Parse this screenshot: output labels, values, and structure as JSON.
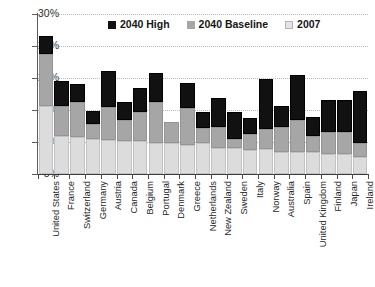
{
  "chart_data": {
    "type": "bar",
    "subtype": "stacked-bar",
    "title": "",
    "xlabel": "",
    "ylabel": "",
    "ylim": [
      5,
      30
    ],
    "ytick_labels": [
      "30%",
      "25%",
      "20%",
      "15%",
      "10%",
      "5%"
    ],
    "ytick_values": [
      30,
      25,
      20,
      15,
      10,
      5
    ],
    "grid": true,
    "grid_axis": "y",
    "legend_position": "top-center",
    "units": "percent",
    "stacked_cumulative": true,
    "categories": [
      "United States",
      "France",
      "Switzerland",
      "Germany",
      "Austria",
      "Canada",
      "Belgium",
      "Portugal",
      "Denmark",
      "Greece",
      "Netherlands",
      "New Zealand",
      "Sweden",
      "Italy",
      "Norway",
      "Australia",
      "Spain",
      "United Kingdom",
      "Finland",
      "Japan",
      "Ireland"
    ],
    "series": [
      {
        "name": "2007",
        "color": "#dcdcdc",
        "values": [
          15.7,
          11.0,
          10.8,
          10.4,
          10.3,
          10.1,
          10.2,
          9.9,
          9.8,
          9.6,
          9.8,
          9.0,
          9.1,
          8.7,
          8.9,
          8.5,
          8.5,
          8.4,
          8.2,
          8.1,
          7.6
        ]
      },
      {
        "name": "2040 Baseline",
        "color": "#a6a6a6",
        "values": [
          23.8,
          15.7,
          16.3,
          12.8,
          15.4,
          13.5,
          14.7,
          16.2,
          13.1,
          15.3,
          12.2,
          12.4,
          10.4,
          11.3,
          12.1,
          12.4,
          13.5,
          11.0,
          11.6,
          11.5,
          9.9
        ]
      },
      {
        "name": "2040 High",
        "color": "#111111",
        "values": [
          26.6,
          19.5,
          19.0,
          14.9,
          21.1,
          16.2,
          18.5,
          20.8,
          13.1,
          19.2,
          14.7,
          16.9,
          14.7,
          13.8,
          19.8,
          15.7,
          20.4,
          13.9,
          16.5,
          16.6,
          17.9
        ]
      }
    ]
  },
  "legend": {
    "items": [
      {
        "label": "2040 High",
        "swatch": "black-square-icon"
      },
      {
        "label": "2040 Baseline",
        "swatch": "gray-square-icon"
      },
      {
        "label": "2007",
        "swatch": "light-gray-square-icon"
      }
    ]
  },
  "colors": {
    "series_2007": "#dcdcdc",
    "series_baseline": "#a6a6a6",
    "series_high": "#111111",
    "gridline": "#b9b9b9",
    "axis": "#4a4a4a",
    "text": "#262626",
    "background": "#ffffff"
  }
}
